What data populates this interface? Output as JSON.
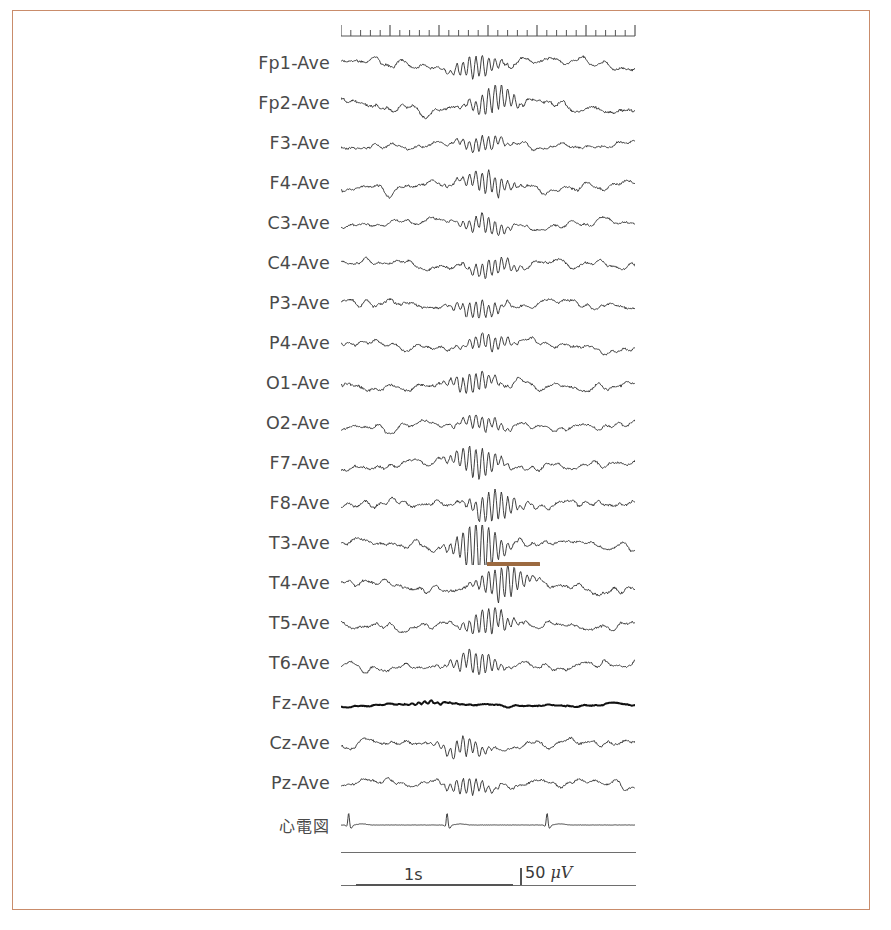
{
  "document": {
    "type": "eeg-recording-chart",
    "montage": "Average reference (Ave)",
    "frame_color": "#c98c6b",
    "trace_color": "#2b2b2b",
    "label_color": "#4a4a4a",
    "annotation_color": "#9c6a40"
  },
  "ruler": {
    "name": "time-ruler",
    "minor_tick_count": 30,
    "major_tick_every": 5,
    "minor_tick_height": 6,
    "major_tick_height": 11,
    "width": 294,
    "baseline_y": 12
  },
  "channels": [
    {
      "label": "Fp1-Ave",
      "name": "channel-fp1-ave",
      "seed": 11,
      "amp": 5.0,
      "burst": 0.46,
      "burst_amp": 3.0,
      "style": "normal"
    },
    {
      "label": "Fp2-Ave",
      "name": "channel-fp2-ave",
      "seed": 23,
      "amp": 5.6,
      "burst": 0.52,
      "burst_amp": 3.2,
      "style": "normal"
    },
    {
      "label": "F3-Ave",
      "name": "channel-f3-ave",
      "seed": 37,
      "amp": 4.4,
      "burst": 0.48,
      "burst_amp": 2.4,
      "style": "normal"
    },
    {
      "label": "F4-Ave",
      "name": "channel-f4-ave",
      "seed": 41,
      "amp": 5.0,
      "burst": 0.5,
      "burst_amp": 3.0,
      "style": "normal"
    },
    {
      "label": "C3-Ave",
      "name": "channel-c3-ave",
      "seed": 53,
      "amp": 4.2,
      "burst": 0.49,
      "burst_amp": 2.8,
      "style": "normal"
    },
    {
      "label": "C4-Ave",
      "name": "channel-c4-ave",
      "seed": 67,
      "amp": 4.6,
      "burst": 0.51,
      "burst_amp": 2.6,
      "style": "normal"
    },
    {
      "label": "P3-Ave",
      "name": "channel-p3-ave",
      "seed": 71,
      "amp": 4.8,
      "burst": 0.47,
      "burst_amp": 2.5,
      "style": "normal"
    },
    {
      "label": "P4-Ave",
      "name": "channel-p4-ave",
      "seed": 83,
      "amp": 4.4,
      "burst": 0.5,
      "burst_amp": 2.4,
      "style": "normal"
    },
    {
      "label": "O1-Ave",
      "name": "channel-o1-ave",
      "seed": 97,
      "amp": 5.2,
      "burst": 0.45,
      "burst_amp": 2.6,
      "style": "normal"
    },
    {
      "label": "O2-Ave",
      "name": "channel-o2-ave",
      "seed": 103,
      "amp": 4.4,
      "burst": 0.48,
      "burst_amp": 2.2,
      "style": "normal"
    },
    {
      "label": "F7-Ave",
      "name": "channel-f7-ave",
      "seed": 109,
      "amp": 4.6,
      "burst": 0.46,
      "burst_amp": 4.6,
      "style": "normal"
    },
    {
      "label": "F8-Ave",
      "name": "channel-f8-ave",
      "seed": 127,
      "amp": 5.4,
      "burst": 0.52,
      "burst_amp": 4.0,
      "style": "normal"
    },
    {
      "label": "T3-Ave",
      "name": "channel-t3-ave",
      "seed": 139,
      "amp": 4.6,
      "burst": 0.47,
      "burst_amp": 7.5,
      "style": "normal"
    },
    {
      "label": "T4-Ave",
      "name": "channel-t4-ave",
      "seed": 149,
      "amp": 5.2,
      "burst": 0.55,
      "burst_amp": 4.4,
      "style": "normal"
    },
    {
      "label": "T5-Ave",
      "name": "channel-t5-ave",
      "seed": 157,
      "amp": 4.8,
      "burst": 0.5,
      "burst_amp": 3.6,
      "style": "normal"
    },
    {
      "label": "T6-Ave",
      "name": "channel-t6-ave",
      "seed": 167,
      "amp": 4.6,
      "burst": 0.46,
      "burst_amp": 3.4,
      "style": "normal"
    },
    {
      "label": "Fz-Ave",
      "name": "channel-fz-ave",
      "seed": 179,
      "amp": 1.7,
      "burst": 0.3,
      "burst_amp": 1.1,
      "style": "bold"
    },
    {
      "label": "Cz-Ave",
      "name": "channel-cz-ave",
      "seed": 191,
      "amp": 4.6,
      "burst": 0.42,
      "burst_amp": 2.6,
      "style": "normal"
    },
    {
      "label": "Pz-Ave",
      "name": "channel-pz-ave",
      "seed": 197,
      "amp": 4.4,
      "burst": 0.43,
      "burst_amp": 2.4,
      "style": "normal"
    },
    {
      "label": "心電図",
      "name": "channel-ecg",
      "seed": 211,
      "amp": 1.2,
      "burst": 0.0,
      "burst_amp": 0.0,
      "style": "ecg"
    }
  ],
  "annotation": {
    "name": "t3-burst-marker",
    "target_channel": "T3-Ave",
    "left": 487,
    "top": 562,
    "width": 53
  },
  "calibration": {
    "time_label": "1s",
    "amplitude_label": "50",
    "amplitude_unit": "μV",
    "time_bar_left": 15,
    "time_bar_width": 157,
    "amp_tick_left": 179,
    "amp_tick_height": 17
  },
  "layout": {
    "first_row_top": 45,
    "row_height": 40,
    "trace_left": 341,
    "trace_width": 294,
    "trace_height": 40
  }
}
